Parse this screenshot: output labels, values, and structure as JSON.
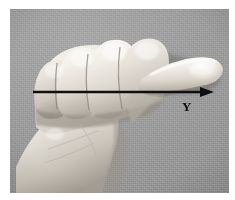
{
  "figure": {
    "kind": "photograph",
    "background_color": "#9b9b9b",
    "skin_highlight_color": "#f2f0ec",
    "skin_midtone_color": "#d8d4cd",
    "skin_shadow_color": "#9c958c",
    "frame_color": "#ffffff"
  },
  "annotation": {
    "arrow": {
      "label": "Y",
      "color": "#101010",
      "direction": "right",
      "start_x": 23,
      "start_y": 83,
      "end_x": 204,
      "end_y": 83,
      "line_width": 2.4,
      "head_length": 13,
      "head_width": 10
    },
    "axis_label": {
      "text": "Y",
      "x": 176,
      "y": 98,
      "color": "#111111"
    }
  }
}
